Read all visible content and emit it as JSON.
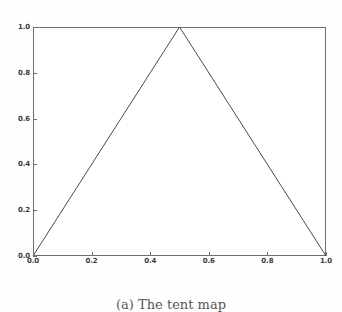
{
  "figure": {
    "caption": "(a) The tent map",
    "background_color": "#fefefe",
    "plot_background_color": "#ffffff",
    "frame_color": "#6e6e6e",
    "line_color": "#4a4a4a"
  },
  "chart_data": {
    "type": "line",
    "title": "",
    "xlabel": "",
    "ylabel": "",
    "xlim": [
      0.0,
      1.0
    ],
    "ylim": [
      0.0,
      1.0
    ],
    "grid": false,
    "legend": null,
    "xticks": [
      0.0,
      0.2,
      0.4,
      0.6,
      0.8,
      1.0
    ],
    "yticks": [
      0.0,
      0.2,
      0.4,
      0.6,
      0.8,
      1.0
    ],
    "xticklabels": [
      "0.0",
      "0.2",
      "0.4",
      "0.6",
      "0.8",
      "1.0"
    ],
    "yticklabels": [
      "0.0",
      "0.2",
      "0.4",
      "0.6",
      "0.8",
      "1.0"
    ],
    "series": [
      {
        "name": "tent",
        "x": [
          0.0,
          0.5,
          1.0
        ],
        "y": [
          0.0,
          1.0,
          0.0
        ],
        "color": "#4a4a4a",
        "linewidth": 1.0,
        "style": "solid"
      }
    ]
  }
}
